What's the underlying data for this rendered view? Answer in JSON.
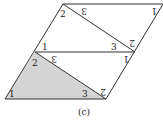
{
  "caption": "(c)",
  "colors": {
    "stroke": "#333333",
    "shaded_fill": "#d4d4d4",
    "background": "#ffffff"
  },
  "labels": {
    "bottom_triangle": {
      "angle_left": "1",
      "angle_top": "2",
      "angle_right": "3"
    },
    "lower_flipped_triangle": {
      "angle_top_left": "3",
      "angle_top_right": "1",
      "angle_bottom_right": "2"
    },
    "middle_triangle": {
      "angle_left": "1",
      "angle_top": "2",
      "angle_right": "3"
    },
    "upper_flipped_triangle": {
      "angle_top_left": "3",
      "angle_top_right": "1",
      "angle_bottom_right": "2"
    }
  }
}
